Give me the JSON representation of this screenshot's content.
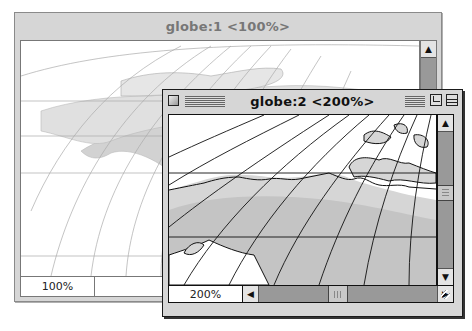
{
  "windows": [
    {
      "title": "globe:1 <100%>",
      "zoom_field": "100%",
      "state": "inactive",
      "content": "Map of North America with graticule (orthographic/globe projection)",
      "scroll": {
        "vertical": true,
        "horizontal": false
      }
    },
    {
      "title": "globe:2 <200%>",
      "zoom_field": "200%",
      "state": "active",
      "content": "Zoomed map of Arctic North America coastline with graticule",
      "scroll": {
        "vertical": true,
        "horizontal": true
      }
    }
  ],
  "icons": {
    "up": "▲",
    "down": "▼",
    "left": "◀",
    "right": "▶"
  },
  "colors": {
    "window_frame": "#d6d6d6",
    "land": "#c8c8c8",
    "land_dark": "#8a8a8a",
    "ocean": "#ffffff",
    "scroll_track": "#999999"
  }
}
